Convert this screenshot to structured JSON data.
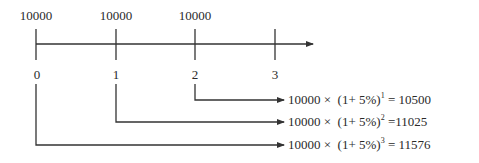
{
  "diagram": {
    "type": "timeline-compound-interest",
    "amounts": [
      "10000",
      "10000",
      "10000"
    ],
    "periods": [
      "0",
      "1",
      "2",
      "3"
    ],
    "formulas": [
      {
        "base": "10000 ×",
        "factor": "(1+ 5%)",
        "exponent": "1",
        "result": "= 10500"
      },
      {
        "base": "10000 ×",
        "factor": "(1+ 5%)",
        "exponent": "2",
        "result": "=11025"
      },
      {
        "base": "10000 ×",
        "factor": "(1+ 5%)",
        "exponent": "3",
        "result": "= 11576"
      }
    ],
    "line_color": "#333333"
  }
}
